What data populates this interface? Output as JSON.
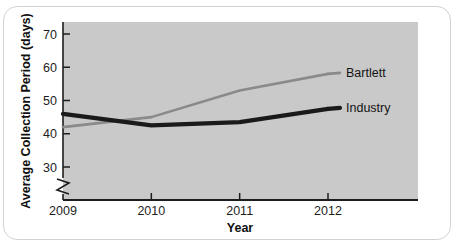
{
  "card": {
    "background": "#ffffff",
    "border_color": "#d2d2d2"
  },
  "chart_data": {
    "type": "line",
    "title": "",
    "subtitle": "",
    "xlabel": "Year",
    "ylabel": "Average Collection Period (days)",
    "categories": [
      "2009",
      "2010",
      "2011",
      "2012"
    ],
    "x": [
      2009,
      2010,
      2011,
      2012
    ],
    "xlim": [
      2009,
      2012
    ],
    "ylim": [
      30,
      74
    ],
    "yticks": [
      30,
      40,
      50,
      60,
      70
    ],
    "ytick_labels": [
      "30",
      "40",
      "50",
      "60",
      "70"
    ],
    "xtick_labels": [
      "2009",
      "2010",
      "2011",
      "2012"
    ],
    "grid": false,
    "legend_position": "inline-right",
    "axis_break": true,
    "axis_break_note": "zigzag break on y-axis below 30",
    "plot_background": "#c9c9c9",
    "series": [
      {
        "name": "Bartlett",
        "values": [
          42,
          45,
          53,
          58
        ],
        "color": "#8a8a8a",
        "width": 2.6,
        "label": "Bartlett"
      },
      {
        "name": "Industry",
        "values": [
          46,
          42.5,
          43.5,
          47.5
        ],
        "color": "#1a1a1a",
        "width": 4.2,
        "label": "Industry"
      }
    ],
    "annotations": []
  }
}
